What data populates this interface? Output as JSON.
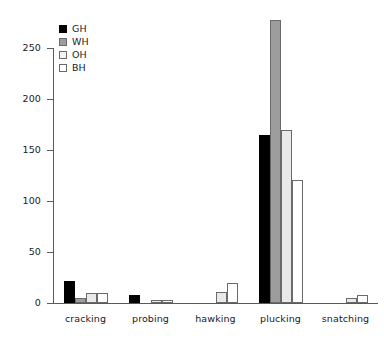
{
  "chart_data": {
    "type": "bar",
    "title": "",
    "subtitle": "",
    "xlabel": "",
    "ylabel": "",
    "categories": [
      "cracking",
      "probing",
      "hawking",
      "plucking",
      "snatching"
    ],
    "series": [
      {
        "name": "GH",
        "color": "#000000",
        "values": [
          22,
          8,
          0,
          165,
          0
        ]
      },
      {
        "name": "WH",
        "color": "#9d9d9d",
        "values": [
          5,
          0,
          0,
          277,
          0
        ]
      },
      {
        "name": "OH",
        "color": "#e9e9e9",
        "values": [
          10,
          3,
          11,
          170,
          5
        ]
      },
      {
        "name": "BH",
        "color": "#ffffff",
        "values": [
          10,
          3,
          20,
          121,
          8
        ]
      }
    ],
    "ylim": [
      0,
      250
    ],
    "yticks": [
      0,
      50,
      100,
      150,
      200,
      250
    ],
    "ytick_labels": [
      "0",
      "50",
      "100",
      "150",
      "200",
      "250"
    ],
    "grid": false,
    "legend": {
      "position": "top-left",
      "entries": [
        "GH",
        "WH",
        "OH",
        "BH"
      ]
    },
    "axis_color": "#5a5a5a",
    "background": "#ffffff"
  }
}
